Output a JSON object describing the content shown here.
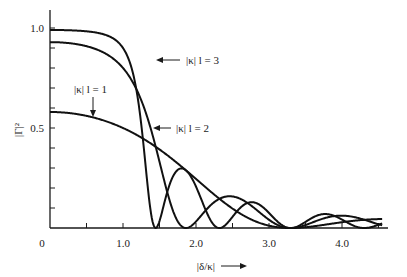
{
  "chart_data": {
    "type": "line",
    "title": "",
    "xlabel": "|δ/κ| →",
    "ylabel": "|Γ|²",
    "xlim": [
      0,
      4.6
    ],
    "ylim": [
      0,
      1.05
    ],
    "x_ticks": [
      0.5,
      1.0,
      1.5,
      2.0,
      2.5,
      3.0,
      3.5,
      4.0,
      4.5
    ],
    "x_tick_labels": [
      {
        "value": 0,
        "label": "0"
      },
      {
        "value": 1.0,
        "label": "1.0"
      },
      {
        "value": 2.0,
        "label": "2.0"
      },
      {
        "value": 3.0,
        "label": "3.0"
      },
      {
        "value": 4.0,
        "label": "4.0"
      }
    ],
    "y_ticks": [
      0.1,
      0.2,
      0.3,
      0.4,
      0.5,
      0.6,
      0.7,
      0.8,
      0.9,
      1.0
    ],
    "y_tick_labels": [
      {
        "value": 0.5,
        "label": "0.5"
      },
      {
        "value": 1.0,
        "label": "1.0"
      }
    ],
    "grid": false,
    "legend": "inline annotations with arrows",
    "series": [
      {
        "name": "|κ|l = 1",
        "kl": 1,
        "x": [
          0,
          0.5,
          1.0,
          1.5,
          2.0,
          2.5,
          3.0,
          3.5,
          4.0,
          4.5
        ],
        "values": [
          0.58,
          0.53,
          0.43,
          0.31,
          0.21,
          0.15,
          0.1,
          0.07,
          0.05,
          0.04
        ]
      },
      {
        "name": "|κ|l = 2",
        "kl": 2,
        "x": [
          0,
          0.5,
          1.0,
          1.2,
          1.5,
          1.8,
          2.0,
          2.3,
          2.5,
          2.8,
          3.0,
          3.3,
          3.6,
          4.0,
          4.5
        ],
        "values": [
          0.93,
          0.9,
          0.8,
          0.66,
          0.42,
          0.14,
          0.04,
          0.0,
          0.06,
          0.12,
          0.1,
          0.02,
          0.0,
          0.04,
          0.06
        ]
      },
      {
        "name": "|κ|l = 3",
        "kl": 3,
        "x": [
          0,
          0.5,
          1.0,
          1.2,
          1.45,
          1.6,
          1.8,
          2.0,
          2.2,
          2.5,
          2.8,
          3.0,
          3.3,
          3.6,
          4.0,
          4.5
        ],
        "values": [
          0.99,
          0.98,
          0.9,
          0.72,
          0.0,
          0.18,
          0.3,
          0.14,
          0.0,
          0.16,
          0.0,
          0.09,
          0.0,
          0.03,
          0.07,
          0.0
        ]
      }
    ],
    "annotations": [
      {
        "text": "|κ| l = 3",
        "arrow_to": [
          1.28,
          0.9
        ]
      },
      {
        "text": "|κ| l = 2",
        "arrow_to": [
          1.4,
          0.36
        ]
      },
      {
        "text": "|κ| l = 1",
        "arrow_to": [
          0.65,
          0.54
        ]
      }
    ]
  },
  "labels": {
    "y_axis": "|Γ|²",
    "x_axis": "|δ/κ|",
    "origin": "0",
    "x_1": "1.0",
    "x_2": "2.0",
    "x_3": "3.0",
    "x_4": "4.0",
    "y_05": "0.5",
    "y_10": "1.0",
    "curve_kl1": "|κ| l = 1",
    "curve_kl2": "|κ| l = 2",
    "curve_kl3": "|κ| l = 3"
  }
}
